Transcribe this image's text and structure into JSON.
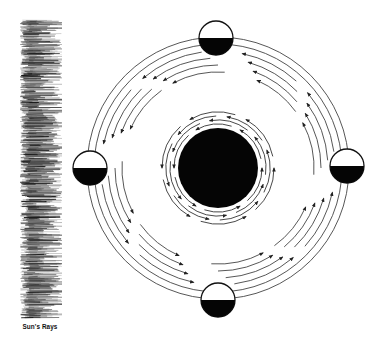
{
  "diagram": {
    "caption": "Sun's Rays",
    "colors": {
      "ink": "#111111",
      "line": "#444444",
      "background": "#ffffff"
    },
    "earth": {
      "label": "earth-disc",
      "cx": 218,
      "cy": 168,
      "r": 40
    },
    "moons": [
      {
        "position": "top",
        "cx": 216,
        "cy": 38,
        "r": 17,
        "dark_half": "bottom"
      },
      {
        "position": "left",
        "cx": 90,
        "cy": 168,
        "r": 17,
        "dark_half": "bottom"
      },
      {
        "position": "right",
        "cx": 347,
        "cy": 166,
        "r": 17,
        "dark_half": "bottom"
      },
      {
        "position": "bottom",
        "cx": 218,
        "cy": 300,
        "r": 17,
        "dark_half": "bottom"
      }
    ],
    "orbit_direction": "counter-clockwise",
    "sun_rays_bar": {
      "x": 20,
      "y": 20,
      "width": 38,
      "height": 298
    }
  }
}
